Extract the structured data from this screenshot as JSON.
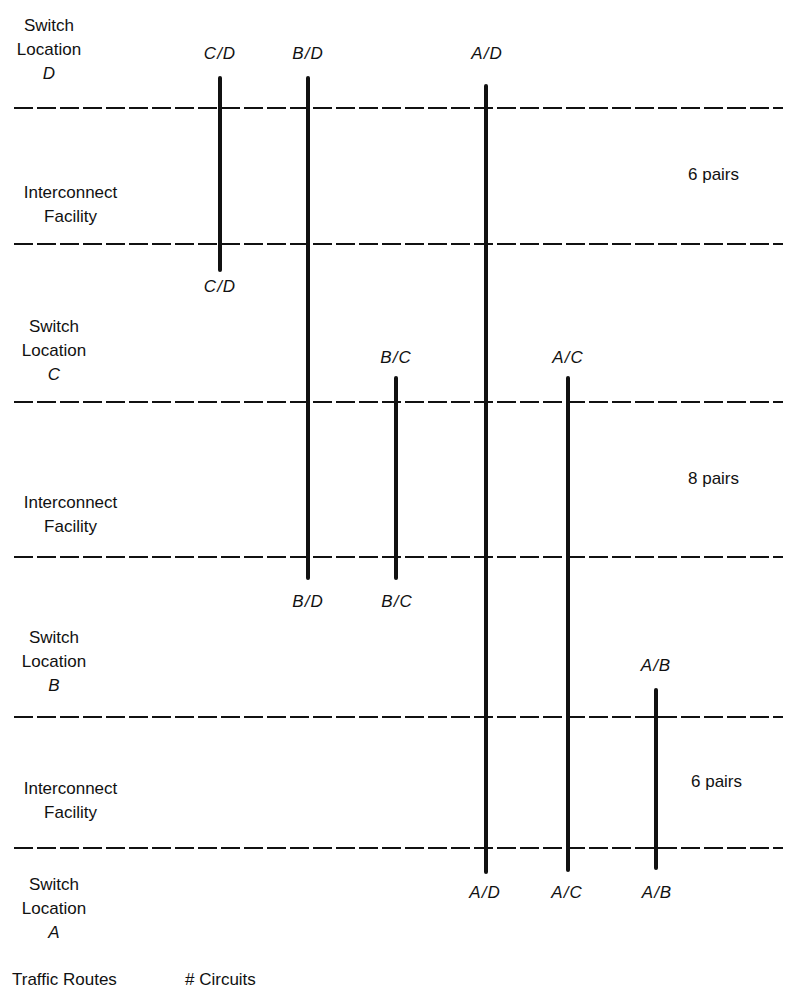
{
  "diagram": {
    "locations": [
      {
        "label_line1": "Switch",
        "label_line2": "Location",
        "letter": "D"
      },
      {
        "label_line1": "Switch",
        "label_line2": "Location",
        "letter": "C"
      },
      {
        "label_line1": "Switch",
        "label_line2": "Location",
        "letter": "B"
      },
      {
        "label_line1": "Switch",
        "label_line2": "Location",
        "letter": "A"
      }
    ],
    "facilities": [
      {
        "label_line1": "Interconnect",
        "label_line2": "Facility",
        "circuits": "6 pairs",
        "between": "D-C"
      },
      {
        "label_line1": "Interconnect",
        "label_line2": "Facility",
        "circuits": "8 pairs",
        "between": "C-B"
      },
      {
        "label_line1": "Interconnect",
        "label_line2": "Facility",
        "circuits": "6 pairs",
        "between": "B-A"
      }
    ],
    "routes": [
      {
        "id": "C/D",
        "top_label": "C/D",
        "bottom_label": "C/D",
        "from": "D",
        "to": "C"
      },
      {
        "id": "B/D",
        "top_label": "B/D",
        "bottom_label": "B/D",
        "from": "D",
        "to": "B"
      },
      {
        "id": "A/D",
        "top_label": "A/D",
        "bottom_label": "A/D",
        "from": "D",
        "to": "A"
      },
      {
        "id": "B/C",
        "top_label": "B/C",
        "bottom_label": "B/C",
        "from": "C",
        "to": "B"
      },
      {
        "id": "A/C",
        "top_label": "A/C",
        "bottom_label": "A/C",
        "from": "C",
        "to": "A"
      },
      {
        "id": "A/B",
        "top_label": "A/B",
        "bottom_label": "A/B",
        "from": "B",
        "to": "A"
      }
    ],
    "footer": {
      "traffic_routes": "Traffic Routes",
      "circuits": "# Circuits"
    }
  }
}
